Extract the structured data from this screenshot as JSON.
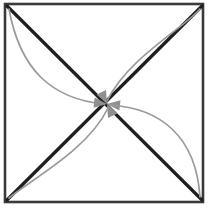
{
  "figure": {
    "caption": "",
    "width": 217,
    "height": 214,
    "background_color": "#ffffff"
  },
  "colors": {
    "frame": "#3a3a3a",
    "diagonal": "#1f1f1f",
    "curve": "#9a9a9a",
    "arrowhead": "#8f8f8f",
    "background": "#ffffff"
  },
  "frame": {
    "name": "square-border",
    "x": 5,
    "y": 4,
    "width": 198,
    "height": 198,
    "stroke_width": 2.6
  },
  "center_point": {
    "name": "convergence-point",
    "x": 107,
    "y": 104
  },
  "corners": [
    {
      "name": "top-left",
      "x": 6,
      "y": 5
    },
    {
      "name": "top-right",
      "x": 202,
      "y": 5
    },
    {
      "name": "bottom-right",
      "x": 202,
      "y": 201
    },
    {
      "name": "bottom-left",
      "x": 6,
      "y": 201
    }
  ],
  "diagonals": [
    {
      "name": "diagonal-tl-br",
      "from": "top-left",
      "to": "bottom-right",
      "path": "M 7 6 L 202 200",
      "stroke_width": 3.2
    },
    {
      "name": "diagonal-bl-tr",
      "from": "bottom-left",
      "to": "top-right",
      "path": "M 7 200 L 202 6",
      "stroke_width": 3.2
    }
  ],
  "curved_arrows": [
    {
      "name": "curve-from-top-left",
      "from": "top-left",
      "to": "center",
      "bow": "below-left-of-diagonal",
      "path": "M 9 9 C 20 70 52 99 104 104",
      "stroke_width": 1.7,
      "arrow_angle_deg": 6
    },
    {
      "name": "curve-from-top-right",
      "from": "top-right",
      "to": "center",
      "bow": "above-left-of-diagonal",
      "path": "M 200 9 C 184 28 128 58 107 101",
      "stroke_width": 1.7,
      "arrow_angle_deg": 64
    },
    {
      "name": "curve-from-bottom-right",
      "from": "bottom-right",
      "to": "center",
      "bow": "above-right-of-diagonal",
      "path": "M 200 197 C 196 136 160 108 110 105",
      "stroke_width": 1.7,
      "arrow_angle_deg": 186
    },
    {
      "name": "curve-from-bottom-left",
      "from": "bottom-left",
      "to": "center",
      "bow": "below-right-of-diagonal",
      "path": "M 9 198 C 30 180 88 150 108 108",
      "stroke_width": 1.7,
      "arrow_angle_deg": 244
    }
  ]
}
